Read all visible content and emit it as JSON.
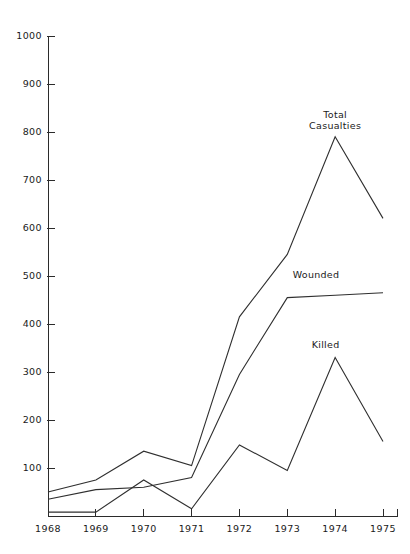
{
  "chart_data": {
    "type": "line",
    "title": "",
    "subtitle": "",
    "xlabel": "",
    "ylabel": "",
    "categories": [
      "1968",
      "1969",
      "1970",
      "1971",
      "1972",
      "1973",
      "1974",
      "1975"
    ],
    "x": [
      1968,
      1969,
      1970,
      1971,
      1972,
      1973,
      1974,
      1975
    ],
    "xlim": [
      1968,
      1975
    ],
    "ylim": [
      0,
      1000
    ],
    "y_ticks": [
      100,
      200,
      300,
      400,
      500,
      600,
      700,
      800,
      900,
      1000
    ],
    "y_tick_labels": [
      "100",
      "200",
      "300",
      "400",
      "500",
      "600",
      "700",
      "800",
      "900",
      "1000"
    ],
    "x_ticks": [
      1968,
      1969,
      1970,
      1971,
      1972,
      1973,
      1974,
      1975
    ],
    "x_tick_labels": [
      "1968",
      "1969",
      "1970",
      "1971",
      "1972",
      "1973",
      "1974",
      "1975"
    ],
    "grid": false,
    "legend": "inline-annotations",
    "series": [
      {
        "name": "Total Casualties",
        "label": "Total Casualties",
        "label_lines": [
          "Total",
          "Casualties"
        ],
        "values": [
          50,
          75,
          135,
          105,
          415,
          545,
          790,
          620
        ]
      },
      {
        "name": "Wounded",
        "label": "Wounded",
        "label_lines": [
          "Wounded"
        ],
        "values": [
          35,
          55,
          60,
          80,
          295,
          455,
          460,
          465
        ]
      },
      {
        "name": "Killed",
        "label": "Killed",
        "label_lines": [
          "Killed"
        ],
        "values": [
          8,
          8,
          75,
          15,
          148,
          95,
          330,
          155
        ]
      }
    ],
    "annotations": [
      {
        "text": "Total Casualties",
        "series": "Total Casualties",
        "x": 1974,
        "y": 830
      },
      {
        "text": "Wounded",
        "series": "Wounded",
        "x": 1973.6,
        "y": 495
      },
      {
        "text": "Killed",
        "series": "Killed",
        "x": 1973.8,
        "y": 350
      }
    ],
    "colors": {
      "line": "#2f2f2f",
      "axis": "#2b2b2b",
      "text": "#1a1a1a",
      "background": "#ffffff"
    }
  }
}
